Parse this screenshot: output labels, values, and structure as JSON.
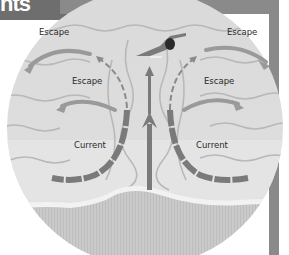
{
  "banner": {
    "title_fragment": "nts"
  },
  "diagram": {
    "labels": {
      "escape_top_left": "Escape",
      "escape_mid_left": "Escape",
      "escape_top_right": "Escape",
      "escape_mid_right": "Escape",
      "current_left": "Current",
      "current_right": "Current"
    },
    "colors": {
      "water": "#d8d8d8",
      "water_light": "#e6e6e6",
      "wave_line": "#b4b4b4",
      "arrow": "#8c8c8c",
      "arrow_dark": "#6e6e6e",
      "sand": "#c8c8c8",
      "frame": "#8a8a8a",
      "banner": "#6e6e6e"
    }
  }
}
